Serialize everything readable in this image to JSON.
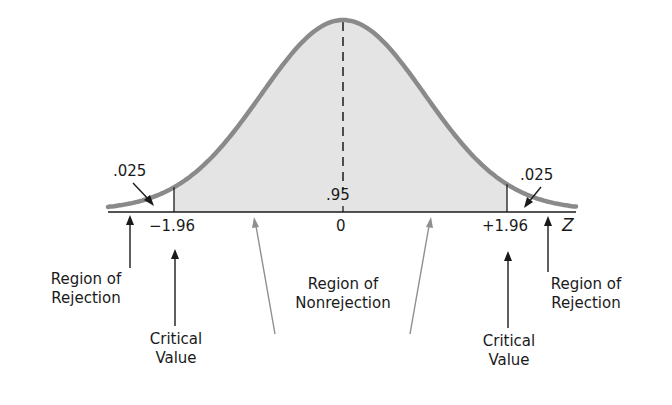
{
  "chart_data": {
    "type": "area",
    "title": "",
    "xlabel": "Z",
    "ylabel": "",
    "distribution": {
      "name": "standard normal",
      "mean": 0,
      "sd": 1
    },
    "tick_labels": [
      "-1.96",
      "0",
      "+1.96"
    ],
    "ticks": [
      -1.96,
      0,
      1.96
    ],
    "regions": [
      {
        "name": "Region of Rejection",
        "from": null,
        "to": -1.96,
        "area": ".025",
        "shaded": false
      },
      {
        "name": "Region of Nonrejection",
        "from": -1.96,
        "to": 1.96,
        "area": ".95",
        "shaded": true
      },
      {
        "name": "Region of Rejection",
        "from": 1.96,
        "to": null,
        "area": ".025",
        "shaded": false
      }
    ],
    "critical_values": [
      -1.96,
      1.96
    ],
    "annotations": [
      ".025",
      ".95",
      ".025",
      "Region of Rejection",
      "Critical Value",
      "Region of Nonrejection",
      "Critical Value",
      "Region of Rejection"
    ],
    "grid": false,
    "legend": null
  },
  "render": {
    "center_x": 343,
    "baseline_y": 210,
    "axis_y": 212,
    "peak_height": 190,
    "sigma_px": 82,
    "x_min": 108,
    "x_max": 576,
    "crit_left_x": 174,
    "crit_right_x": 507,
    "colors": {
      "curve": "#8a8a8a",
      "fill": "#e4e4e4",
      "axis": "#1a1a1a",
      "arrow_dark": "#1a1a1a",
      "arrow_gray": "#8f8f8f"
    }
  },
  "labels": {
    "left_tail_area": ".025",
    "right_tail_area": ".025",
    "center_area": ".95",
    "tick_neg": "−1.96",
    "tick_zero": "0",
    "tick_pos": "+1.96",
    "axis_z": "Z",
    "left_rejection_l1": "Region of",
    "left_rejection_l2": "Rejection",
    "left_critical_l1": "Critical",
    "left_critical_l2": "Value",
    "nonrejection_l1": "Region of",
    "nonrejection_l2": "Nonrejection",
    "right_critical_l1": "Critical",
    "right_critical_l2": "Value",
    "right_rejection_l1": "Region of",
    "right_rejection_l2": "Rejection"
  }
}
